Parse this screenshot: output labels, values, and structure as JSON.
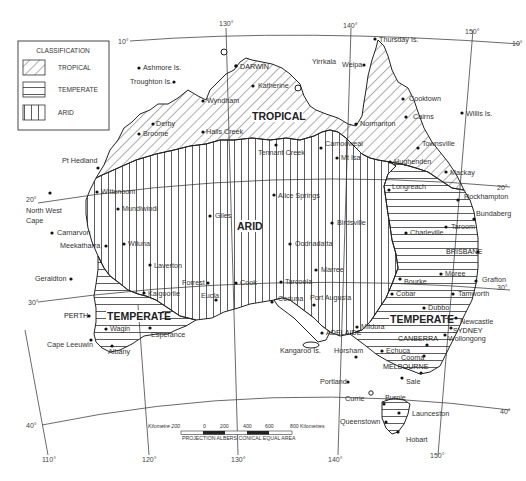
{
  "legend": {
    "title": "CLASSIFICATION",
    "items": [
      {
        "label": "TROPICAL",
        "pattern": "diagonal-hatch"
      },
      {
        "label": "TEMPERATE",
        "pattern": "horizontal-hatch"
      },
      {
        "label": "ARID",
        "pattern": "vertical-hatch"
      }
    ]
  },
  "regions": {
    "tropical": "TROPICAL",
    "arid": "ARID",
    "temperate_west": "TEMPERATE",
    "temperate_east": "TEMPERATE"
  },
  "graticule": {
    "longitudes": [
      "110°",
      "120°",
      "130°",
      "140°",
      "150°"
    ],
    "latitudes_left": [
      "10°",
      "20°",
      "30°",
      "40°"
    ],
    "latitudes_right": [
      "10°",
      "20°",
      "30°",
      "40°"
    ]
  },
  "places": {
    "ashmore": "Ashmore Is.",
    "troughton": "Troughton Is.",
    "darwin": "DARWIN",
    "yirrkala": "Yirrkala",
    "katherine": "Katherine",
    "wyndham": "Wyndham",
    "derby": "Derby",
    "broome": "Broome",
    "halls_creek": "Halls Creek",
    "thursday": "Thursday Is.",
    "weipa": "Weipa",
    "cooktown": "Cooktown",
    "cairns": "Cairns",
    "willis": "Willis Is.",
    "normanton": "Normanton",
    "townsville": "Townsville",
    "camooweal": "Camooweal",
    "mt_isa": "Mt Isa",
    "hughenden": "Hughenden",
    "mackay": "Mackay",
    "tennant_creek": "Tennant Creek",
    "pt_hedland": "Pt Hedland",
    "north_west_cape_1": "North West",
    "north_west_cape_2": "Cape",
    "wittenoom": "Wittenoom",
    "mundiwindi": "Mundiwindi",
    "carnarvon": "Carnarvon",
    "meekatharra": "Meekatharra",
    "wiluna": "Wiluna",
    "giles": "Giles",
    "alice_springs": "Alice Springs",
    "birdsville": "Birdsville",
    "oodnadatta": "Oodnadatta",
    "longreach": "Longreach",
    "rockhampton": "Rockhampton",
    "bundaberg": "Bundaberg",
    "taroom": "Taroom",
    "charleville": "Charleville",
    "brisbane": "BRISBANE",
    "laverton": "Laverton",
    "geraldton": "Geraldton",
    "kalgoorlie": "Kalgoorlie",
    "forrest": "Forrest",
    "eucla": "Eucla",
    "cook": "Cook",
    "tarcoola": "Tarcoola",
    "marree": "Marree",
    "moree": "Moree",
    "bourke": "Bourke",
    "grafton": "Grafton",
    "cobar": "Cobar",
    "tamworth": "Tamworth",
    "dubbo": "Dubbo",
    "perth": "PERTH",
    "wagin": "Wagin",
    "esperance": "Esperance",
    "cape_leeuwin": "Cape Leeuwin",
    "albany": "Albany",
    "ceduna": "Ceduna",
    "port_augusta": "Port Augusta",
    "adelaide": "ADELAIDE",
    "mildura": "Mildura",
    "newcastle": "Newcastle",
    "sydney": "SYDNEY",
    "canberra": "CANBERRA",
    "wollongong": "Wollongong",
    "kangaroo": "Kangaroo Is.",
    "horsham": "Horsham",
    "echuca": "Echuca",
    "cooma": "Cooma",
    "melbourne": "MELBOURNE",
    "portland": "Portland",
    "sale": "Sale",
    "currie": "Currie",
    "burnie": "Burnie",
    "launceston": "Launceston",
    "queenstown": "Queenstown",
    "hobart": "Hobart"
  },
  "scale_bar": {
    "left_label": "Kilometre 200",
    "ticks": [
      "0",
      "200",
      "400",
      "600",
      "800 Kilometres"
    ],
    "projection": "PROJECTION ALBERS CONICAL EQUAL AREA"
  }
}
